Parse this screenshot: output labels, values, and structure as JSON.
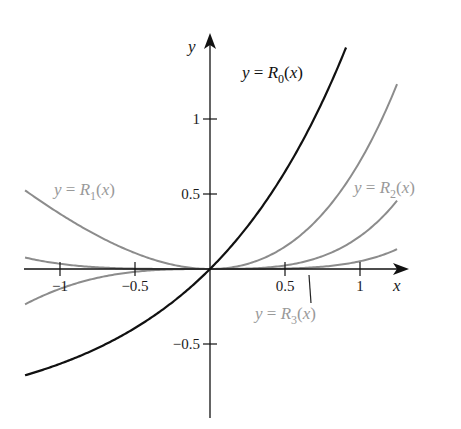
{
  "chart_data": {
    "type": "line",
    "title": "",
    "xlabel": "x",
    "ylabel": "y",
    "xlim": [
      -1.233,
      1.3
    ],
    "ylim": [
      -0.99,
      1.56
    ],
    "grid": false,
    "x_ticks": [
      {
        "value": -1,
        "label": "−1"
      },
      {
        "value": -0.5,
        "label": "−0.5"
      },
      {
        "value": 0.5,
        "label": "0.5"
      },
      {
        "value": 1,
        "label": "1"
      }
    ],
    "y_ticks": [
      {
        "value": 1,
        "label": "1"
      },
      {
        "value": 0.5,
        "label": "0.5"
      },
      {
        "value": -0.5,
        "label": "−0.5"
      }
    ],
    "series": [
      {
        "name": "R0",
        "label_prefix": "y = ",
        "label_fn": "R",
        "label_sub": "0",
        "label_suffix": "(x)",
        "formula": "e^x - 1",
        "x_range": [
          -1.233,
          0.907
        ],
        "color": "#111111",
        "x": [
          -1.233,
          -1.0,
          -0.5,
          0.0,
          0.5,
          0.907
        ],
        "values": [
          -0.709,
          -0.632,
          -0.393,
          0.0,
          0.649,
          1.477
        ]
      },
      {
        "name": "R1",
        "label_prefix": "y = ",
        "label_fn": "R",
        "label_sub": "1",
        "label_suffix": "(x)",
        "formula": "e^x - 1 - x",
        "x_range": [
          -1.233,
          1.247
        ],
        "color": "#8c8c8c",
        "x": [
          -1.233,
          -1.0,
          -0.5,
          0.0,
          0.5,
          1.0,
          1.247
        ],
        "values": [
          0.524,
          0.368,
          0.107,
          0.0,
          0.149,
          0.718,
          1.233
        ]
      },
      {
        "name": "R2",
        "label_prefix": "y = ",
        "label_fn": "R",
        "label_sub": "2",
        "label_suffix": "(x)",
        "formula": "e^x - 1 - x - x^2/2",
        "x_range": [
          -1.233,
          1.247
        ],
        "color": "#8c8c8c",
        "x": [
          -1.233,
          -1.0,
          -0.5,
          0.0,
          0.5,
          1.0,
          1.247
        ],
        "values": [
          -0.236,
          -0.132,
          -0.018,
          0.0,
          0.024,
          0.218,
          0.456
        ]
      },
      {
        "name": "R3",
        "label_prefix": "y = ",
        "label_fn": "R",
        "label_sub": "3",
        "label_suffix": "(x)",
        "formula": "e^x - 1 - x - x^2/2 - x^3/6",
        "x_range": [
          -1.233,
          1.247
        ],
        "color": "#8c8c8c",
        "x": [
          -1.233,
          -1.0,
          -0.5,
          0.0,
          0.5,
          1.0,
          1.247
        ],
        "values": [
          0.076,
          0.035,
          0.003,
          0.0,
          0.003,
          0.052,
          0.133
        ]
      }
    ],
    "annotations": [
      {
        "text": "y = R0(x)",
        "near_series": "R0"
      },
      {
        "text": "y = R1(x)",
        "near_series": "R1"
      },
      {
        "text": "y = R2(x)",
        "near_series": "R2"
      },
      {
        "text": "y = R3(x)",
        "near_series": "R3",
        "leader_line": true
      }
    ],
    "legend": "none (inline labels)"
  },
  "axes": {
    "x_label": "x",
    "y_label": "y",
    "axis_color": "#111111",
    "label_color_dark": "#111111",
    "label_color_light": "#999999"
  }
}
